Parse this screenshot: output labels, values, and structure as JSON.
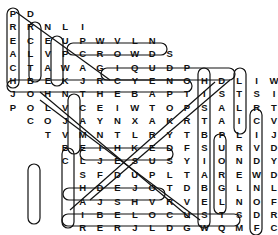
{
  "puzzle": {
    "type": "word-search",
    "cell_w": 17.4,
    "cell_h": 13.4,
    "origin_x": 13,
    "origin_y": 13,
    "rows": [
      {
        "offset": 0,
        "letters": "PD"
      },
      {
        "offset": 0,
        "letters": "RRNLI"
      },
      {
        "offset": 0,
        "letters": "ECEUPWVLN"
      },
      {
        "offset": 0,
        "letters": "ALVPCROWDS"
      },
      {
        "offset": 0,
        "letters": "CTAWAGIQUDP"
      },
      {
        "offset": 0,
        "letters": "HBEKJRCYENOHDLIWTXR"
      },
      {
        "offset": 0,
        "letters": "JOHNTHEBAPTISTSILREPN"
      },
      {
        "offset": 0,
        "letters": "POLVCEIWTOPSALRTECTKP"
      },
      {
        "offset": 1,
        "letters": "COJAYNXAKRTAICVBLARD"
      },
      {
        "offset": 2,
        "letters": "TVMNTLRYTBPLIJRBWEX"
      },
      {
        "offset": 3,
        "letters": "BEIHKEDFSURVDEAKPL"
      },
      {
        "offset": 3,
        "letters": "CLJESUSYIONDYAHPUEK"
      },
      {
        "offset": 4,
        "letters": "SFDUPLTAREWDTTLNB"
      },
      {
        "offset": 4,
        "letters": "HDEJOTDBGLNLAICTA"
      },
      {
        "offset": 4,
        "letters": "AJSHVRVELNOFEZOAT"
      },
      {
        "offset": 4,
        "letters": "IBELOCUSTSDRLERNJ"
      },
      {
        "offset": 4,
        "letters": "RERJLDGWQMFCDAMCP"
      },
      {
        "offset": 4,
        "letters": "YITSSENEVIGROFVER"
      }
    ],
    "found_words": [
      "PREACH",
      "CROWDS",
      "JOHN THE BAPTIST",
      "JESUS",
      "LOCUSTS",
      "FORGIVENESS",
      "WILDERNESS",
      "REPENTANCE",
      "BAPTIZE",
      "BAPTIZE",
      "LEATHER",
      "WATER",
      "HAIR",
      "DESERT",
      "CAMEL",
      "RIVER",
      "JORDAN"
    ]
  }
}
